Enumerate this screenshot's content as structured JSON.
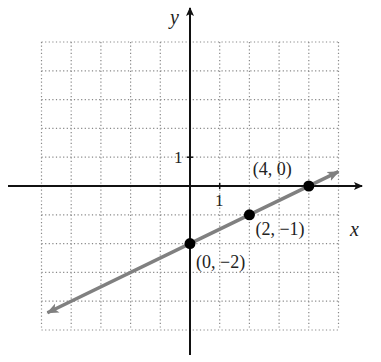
{
  "chart_data": {
    "type": "line",
    "title": "",
    "xlabel": "x",
    "ylabel": "y",
    "xlim": [
      -5,
      5
    ],
    "ylim": [
      -5,
      5
    ],
    "grid": true,
    "grid_style": "dotted",
    "tick_labels": {
      "x": "1",
      "y": "1"
    },
    "series": [
      {
        "name": "line",
        "equation": "y = x/2 - 2",
        "color": "#808080",
        "arrows": "both",
        "x": [
          -4.8,
          5.0
        ],
        "y": [
          -4.4,
          0.5
        ]
      }
    ],
    "points": [
      {
        "x": 0,
        "y": -2,
        "label": "(0, −2)"
      },
      {
        "x": 2,
        "y": -1,
        "label": "(2, −1)"
      },
      {
        "x": 4,
        "y": 0,
        "label": "(4, 0)"
      }
    ],
    "colors": {
      "axis": "#111111",
      "line": "#808080",
      "grid": "#888888",
      "point": "#000000"
    }
  }
}
